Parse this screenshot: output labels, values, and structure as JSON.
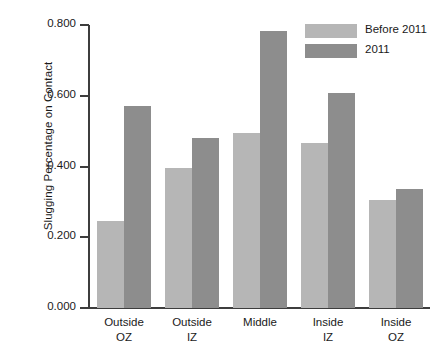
{
  "chart_data": {
    "type": "bar",
    "title": "",
    "subtitle": "",
    "xlabel": "",
    "ylabel": "Slugging Percentage on Contact",
    "ylim": [
      0.0,
      0.8
    ],
    "ytick_labels": [
      "0.000",
      "0.200",
      "0.400",
      "0.600",
      "0.800"
    ],
    "ytick_values": [
      0.0,
      0.2,
      0.4,
      0.6,
      0.8
    ],
    "grid": false,
    "legend_position": "top-right",
    "categories": [
      "Outside OZ",
      "Outside IZ",
      "Middle",
      "Inside IZ",
      "Inside OZ"
    ],
    "category_lines": [
      [
        "Outside",
        "OZ"
      ],
      [
        "Outside",
        "IZ"
      ],
      [
        "Middle",
        ""
      ],
      [
        "Inside",
        "IZ"
      ],
      [
        "Inside",
        "OZ"
      ]
    ],
    "series": [
      {
        "name": "Before 2011",
        "color": "#b6b6b6",
        "values": [
          0.245,
          0.395,
          0.495,
          0.467,
          0.305
        ]
      },
      {
        "name": "2011",
        "color": "#8d8d8d",
        "values": [
          0.572,
          0.482,
          0.783,
          0.609,
          0.337
        ]
      }
    ]
  },
  "legend": {
    "items": [
      {
        "label": "Before 2011",
        "color": "#b6b6b6"
      },
      {
        "label": "2011",
        "color": "#8d8d8d"
      }
    ]
  },
  "axes": {
    "y_title": "Slugging Percentage on Contact",
    "y_ticks": [
      "0.800",
      "0.600",
      "0.400",
      "0.200",
      "0.000"
    ]
  }
}
